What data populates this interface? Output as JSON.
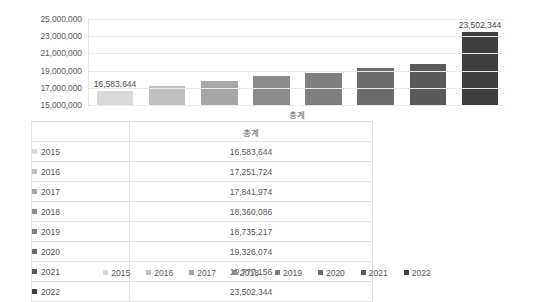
{
  "chart_data": {
    "type": "bar",
    "title": "",
    "xlabel": "",
    "ylabel": "",
    "category_label": "총계",
    "categories": [
      "2015",
      "2016",
      "2017",
      "2018",
      "2019",
      "2020",
      "2021",
      "2022"
    ],
    "values": [
      16583644,
      17251724,
      17841974,
      18360086,
      18735217,
      19326074,
      19777156,
      23502344
    ],
    "value_labels": [
      "16,583,644",
      "17,251,724",
      "17,841,974",
      "18,360,086",
      "18,735,217",
      "19,326,074",
      "19,777,156",
      "23,502,344"
    ],
    "shown_data_labels": {
      "first": "16,583,644",
      "last": "23,502,344"
    },
    "ylim": [
      15000000,
      25000000
    ],
    "y_ticks": [
      25000000,
      23000000,
      21000000,
      19000000,
      17000000,
      15000000
    ],
    "y_tick_labels": [
      "25,000,000",
      "23,000,000",
      "21,000,000",
      "19,000,000",
      "17,000,000",
      "15,000,000"
    ],
    "grid": true,
    "legend_position": "bottom",
    "series_colors": [
      "#d9d9d9",
      "#bfbfbf",
      "#a6a6a6",
      "#8c8c8c",
      "#7f7f7f",
      "#6b6b6b",
      "#595959",
      "#3f3f3f"
    ]
  },
  "table": {
    "header_key": "",
    "header_value": "총계",
    "rows": [
      {
        "year": "2015",
        "value": "16,583,644"
      },
      {
        "year": "2016",
        "value": "17,251,724"
      },
      {
        "year": "2017",
        "value": "17,841,974"
      },
      {
        "year": "2018",
        "value": "18,360,086"
      },
      {
        "year": "2019",
        "value": "18,735,217"
      },
      {
        "year": "2020",
        "value": "19,326,074"
      },
      {
        "year": "2021",
        "value": "19,777,156"
      },
      {
        "year": "2022",
        "value": "23,502,344"
      }
    ]
  },
  "legend": {
    "items": [
      "2015",
      "2016",
      "2017",
      "2018",
      "2019",
      "2020",
      "2021",
      "2022"
    ]
  }
}
